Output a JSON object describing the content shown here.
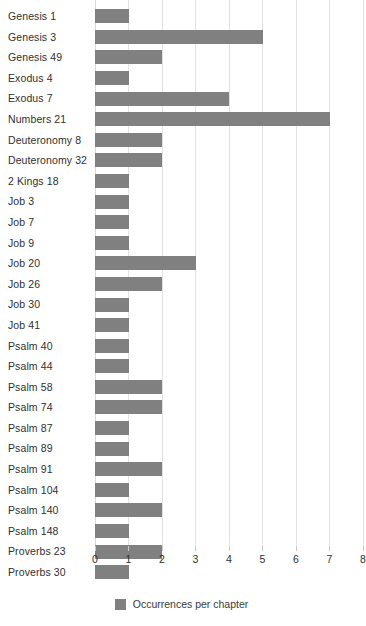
{
  "chart_data": {
    "type": "bar",
    "orientation": "horizontal",
    "title": "",
    "xlabel": "",
    "ylabel": "",
    "xlim": [
      0,
      8
    ],
    "xticks": [
      0,
      1,
      2,
      3,
      4,
      5,
      6,
      7,
      8
    ],
    "xtick_labels": [
      "0",
      "1",
      "2",
      "3",
      "4",
      "5",
      "6",
      "7",
      "8"
    ],
    "grid": true,
    "legend_position": "bottom-center",
    "bar_color": "#808080",
    "gridline_color": "#e2e2e2",
    "categories": [
      "Genesis 1",
      "Genesis 3",
      "Genesis 49",
      "Exodus 4",
      "Exodus 7",
      "Numbers 21",
      "Deuteronomy 8",
      "Deuteronomy 32",
      "2 Kings 18",
      "Job 3",
      "Job 7",
      "Job 9",
      "Job 20",
      "Job 26",
      "Job 30",
      "Job 41",
      "Psalm 40",
      "Psalm 44",
      "Psalm 58",
      "Psalm 74",
      "Psalm 87",
      "Psalm 89",
      "Psalm 91",
      "Psalm 104",
      "Psalm 140",
      "Psalm 148",
      "Proverbs 23",
      "Proverbs 30"
    ],
    "values": [
      1,
      5,
      2,
      1,
      4,
      7,
      2,
      2,
      1,
      1,
      1,
      1,
      3,
      2,
      1,
      1,
      1,
      1,
      2,
      2,
      1,
      1,
      2,
      1,
      2,
      1,
      2,
      1
    ],
    "series": [
      {
        "name": "Occurrences per chapter",
        "values": [
          1,
          5,
          2,
          1,
          4,
          7,
          2,
          2,
          1,
          1,
          1,
          1,
          3,
          2,
          1,
          1,
          1,
          1,
          2,
          2,
          1,
          1,
          2,
          1,
          2,
          1,
          2,
          1
        ]
      }
    ],
    "legend": [
      "Occurrences per chapter"
    ]
  }
}
